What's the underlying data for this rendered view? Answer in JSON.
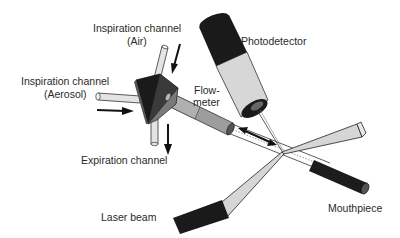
{
  "diagram": {
    "labels": {
      "inspiration_air_line1": "Inspiration channel",
      "inspiration_air_line2": "(Air)",
      "inspiration_aerosol_line1": "Inspiration channel",
      "inspiration_aerosol_line2": "(Aerosol)",
      "photodetector": "Photodetector",
      "flowmeter_line1": "Flow-",
      "flowmeter_line2": "meter",
      "expiration": "Expiration channel",
      "laser_beam": "Laser beam",
      "mouthpiece": "Mouthpiece"
    },
    "components": [
      {
        "id": "valve-block",
        "label": "Valve block"
      },
      {
        "id": "inspiration-air-tube",
        "label": "Inspiration channel (Air)"
      },
      {
        "id": "inspiration-aerosol-tube",
        "label": "Inspiration channel (Aerosol)"
      },
      {
        "id": "expiration-tube",
        "label": "Expiration channel"
      },
      {
        "id": "flowmeter-tube",
        "label": "Flowmeter"
      },
      {
        "id": "photodetector",
        "label": "Photodetector"
      },
      {
        "id": "laser-beam",
        "label": "Laser beam"
      },
      {
        "id": "mouthpiece",
        "label": "Mouthpiece"
      }
    ],
    "colors": {
      "dark": "#1a1a1a",
      "light_tube": "#e4e4e4",
      "mid_gray": "#9a9a9a",
      "outline": "#333333",
      "background": "#ffffff"
    }
  }
}
